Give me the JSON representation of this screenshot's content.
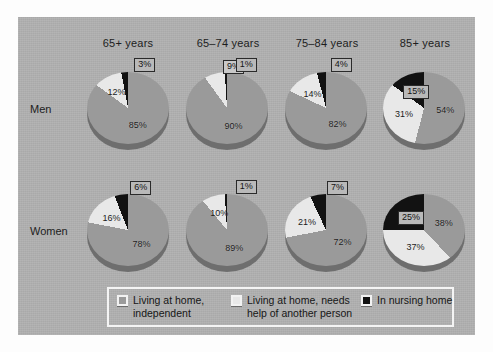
{
  "figure": {
    "row_labels": [
      "Men",
      "Women"
    ],
    "column_headers": [
      "65+ years",
      "65–74 years",
      "75–84 years",
      "85+ years"
    ],
    "background_color": "#b0b0b0",
    "legend": {
      "items": [
        {
          "label_line1": "Living at home,",
          "label_line2": "independent",
          "color": "#9a9a9a",
          "swatch_name": "legend-swatch-independent"
        },
        {
          "label_line1": "Living at home, needs",
          "label_line2": "help of another person",
          "color": "#e8e8e8",
          "swatch_name": "legend-swatch-needs-help"
        },
        {
          "label_line1": "In nursing home",
          "label_line2": "",
          "color": "#121212",
          "swatch_name": "legend-swatch-nursing-home"
        }
      ]
    }
  },
  "chart_data": {
    "type": "pie",
    "title": "",
    "categories": [
      "Living at home, independent",
      "Living at home, needs help of another person",
      "In nursing home"
    ],
    "colors": [
      "#9a9a9a",
      "#e8e8e8",
      "#121212"
    ],
    "units": "%",
    "groups": [
      "Men",
      "Women"
    ],
    "age_bands": [
      "65+ years",
      "65–74 years",
      "75–84 years",
      "85+ years"
    ],
    "charts": [
      {
        "group": "Men",
        "age_band": "65+ years",
        "values": [
          85,
          12,
          3
        ],
        "labels": [
          "85%",
          "12%",
          "3%"
        ]
      },
      {
        "group": "Men",
        "age_band": "65–74 years",
        "values": [
          90,
          9,
          1
        ],
        "labels": [
          "90%",
          "9%",
          "1%"
        ]
      },
      {
        "group": "Men",
        "age_band": "75–84 years",
        "values": [
          82,
          14,
          4
        ],
        "labels": [
          "82%",
          "14%",
          "4%"
        ]
      },
      {
        "group": "Men",
        "age_band": "85+ years",
        "values": [
          54,
          31,
          15
        ],
        "labels": [
          "54%",
          "31%",
          "15%"
        ]
      },
      {
        "group": "Women",
        "age_band": "65+ years",
        "values": [
          78,
          16,
          6
        ],
        "labels": [
          "78%",
          "16%",
          "6%"
        ]
      },
      {
        "group": "Women",
        "age_band": "65–74 years",
        "values": [
          89,
          10,
          1
        ],
        "labels": [
          "89%",
          "10%",
          "1%"
        ]
      },
      {
        "group": "Women",
        "age_band": "75–84 years",
        "values": [
          72,
          21,
          7
        ],
        "labels": [
          "72%",
          "21%",
          "7%"
        ]
      },
      {
        "group": "Women",
        "age_band": "85+ years",
        "values": [
          38,
          37,
          25
        ],
        "labels": [
          "38%",
          "37%",
          "25%"
        ]
      }
    ]
  }
}
